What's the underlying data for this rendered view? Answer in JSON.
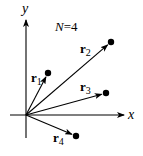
{
  "diagram": {
    "title": "N=4",
    "title_parts": {
      "n": "N",
      "eq": "=4"
    },
    "axes": {
      "x_label": "x",
      "y_label": "y",
      "origin": [
        26,
        115
      ],
      "x_start": 10,
      "x_end": 124,
      "y_top": 20,
      "y_bottom": 138
    },
    "colors": {
      "stroke": "#000000",
      "background": "#ffffff"
    },
    "vectors": [
      {
        "id": "r1",
        "base": "r",
        "sub": "1",
        "tip": [
          48,
          73
        ],
        "label_pos": [
          31,
          82
        ]
      },
      {
        "id": "r2",
        "base": "r",
        "sub": "2",
        "tip": [
          111,
          42
        ],
        "label_pos": [
          80,
          53
        ]
      },
      {
        "id": "r3",
        "base": "r",
        "sub": "3",
        "tip": [
          106,
          93
        ],
        "label_pos": [
          80,
          91
        ]
      },
      {
        "id": "r4",
        "base": "r",
        "sub": "4",
        "tip": [
          76,
          136
        ],
        "label_pos": [
          53,
          142
        ]
      }
    ]
  }
}
